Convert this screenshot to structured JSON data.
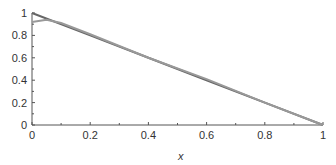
{
  "chart_data": {
    "type": "line",
    "title": "",
    "xlabel": "x",
    "ylabel": "",
    "xlim": [
      0,
      1
    ],
    "ylim": [
      0,
      1
    ],
    "xticks": [
      "0",
      "0.2",
      "0.4",
      "0.6",
      "0.8",
      "1"
    ],
    "yticks": [
      "0",
      "0.2",
      "0.4",
      "0.6",
      "0.8",
      "1"
    ],
    "grid": false,
    "series": [
      {
        "name": "exact",
        "x": [
          0,
          0.2,
          0.4,
          0.6,
          0.8,
          1
        ],
        "values": [
          1,
          0.8,
          0.6,
          0.4,
          0.2,
          0
        ]
      },
      {
        "name": "approximation",
        "x": [
          0,
          0.05,
          0.1,
          0.2,
          0.4,
          0.6,
          0.8,
          1
        ],
        "values": [
          0.92,
          0.94,
          0.91,
          0.81,
          0.6,
          0.41,
          0.2,
          0
        ]
      }
    ]
  },
  "axis": {
    "x_label": "x"
  }
}
